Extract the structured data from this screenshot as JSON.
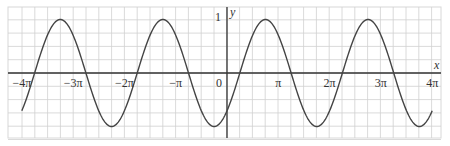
{
  "chart_data": {
    "type": "line",
    "title": "",
    "function": "y = sin(x - π/4)",
    "xlabel": "x",
    "ylabel": "y",
    "xlim": [
      -12.566,
      12.566
    ],
    "ylim": [
      -1.2,
      1.2
    ],
    "grid": true,
    "x_ticks": [
      {
        "value": -12.566,
        "label": "−4π"
      },
      {
        "value": -9.425,
        "label": "−3π"
      },
      {
        "value": -6.283,
        "label": "−2π"
      },
      {
        "value": -3.142,
        "label": "−π"
      },
      {
        "value": 0,
        "label": "0"
      },
      {
        "value": 3.142,
        "label": "π"
      },
      {
        "value": 6.283,
        "label": "2π"
      },
      {
        "value": 9.425,
        "label": "3π"
      },
      {
        "value": 12.566,
        "label": "4π"
      }
    ],
    "y_ticks": [
      {
        "value": 1,
        "label": "1"
      }
    ],
    "series": [
      {
        "name": "sin(x − π/4)",
        "x_range": [
          -12.566,
          12.566
        ],
        "amplitude": 1,
        "period": 6.283,
        "phase_shift": 0.785,
        "key_points": [
          {
            "x": -12.566,
            "y": -0.707
          },
          {
            "x": -9.425,
            "y": 0.707
          },
          {
            "x": -6.283,
            "y": -0.707
          },
          {
            "x": -3.142,
            "y": 0.707
          },
          {
            "x": 0,
            "y": -0.707
          },
          {
            "x": 0.785,
            "y": 0
          },
          {
            "x": 2.356,
            "y": 1
          },
          {
            "x": 3.142,
            "y": 0.707
          },
          {
            "x": 3.927,
            "y": 0
          },
          {
            "x": 5.498,
            "y": -1
          },
          {
            "x": 6.283,
            "y": -0.707
          },
          {
            "x": 9.425,
            "y": 0.707
          },
          {
            "x": 12.566,
            "y": -0.707
          }
        ],
        "color": "#333333"
      }
    ]
  },
  "axes": {
    "x_label": "x",
    "y_label": "y",
    "y_one_label": "1"
  },
  "colors": {
    "grid": "#d0d0d0",
    "axis": "#333333",
    "curve": "#444444",
    "frame": "#d8d8d8"
  }
}
